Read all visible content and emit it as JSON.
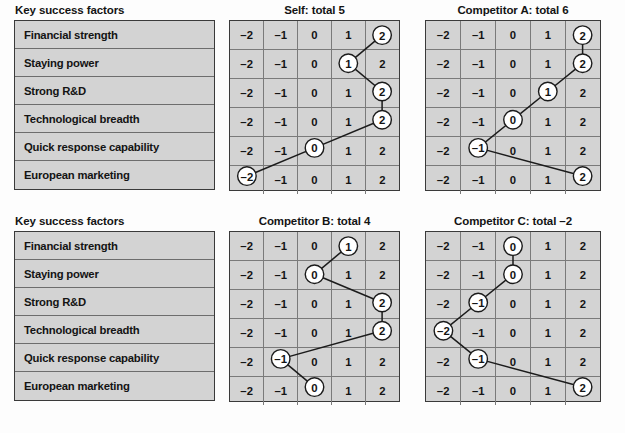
{
  "factors_caption": "Key success factors",
  "factors": [
    "Financial strength",
    "Staying power",
    "Strong R&D",
    "Technological breadth",
    "Quick response capability",
    "European marketing"
  ],
  "scale": [
    "–2",
    "–1",
    "0",
    "1",
    "2"
  ],
  "chart_data": {
    "type": "line",
    "xlabel": "",
    "ylabel": "Key success factors",
    "x": [
      -2,
      -1,
      0,
      1,
      2
    ],
    "tick_labels": [
      "–2",
      "–1",
      "0",
      "1",
      "2"
    ],
    "categories": [
      "Financial strength",
      "Staying power",
      "Strong R&D",
      "Technological breadth",
      "Quick response capability",
      "European marketing"
    ],
    "xlim": [
      -2,
      2
    ],
    "grid": true,
    "legend": "none",
    "series": [
      {
        "name": "Self",
        "title": "Self: total 5",
        "total": 5,
        "total_label": "5",
        "values": [
          2,
          1,
          2,
          2,
          0,
          -2
        ]
      },
      {
        "name": "Competitor A",
        "title": "Competitor A: total 6",
        "total": 6,
        "total_label": "6",
        "values": [
          2,
          2,
          1,
          0,
          -1,
          2
        ]
      },
      {
        "name": "Competitor B",
        "title": "Competitor B: total 4",
        "total": 4,
        "total_label": "4",
        "values": [
          1,
          0,
          2,
          2,
          -1,
          0
        ]
      },
      {
        "name": "Competitor C",
        "title": "Competitor C: total –2",
        "total": -2,
        "total_label": "–2",
        "values": [
          0,
          0,
          -1,
          -2,
          -1,
          2
        ]
      }
    ]
  },
  "panels": [
    {
      "caption": "Key success factors",
      "charts": [
        0,
        1
      ]
    },
    {
      "caption": "Key success factors",
      "charts": [
        2,
        3
      ]
    }
  ]
}
